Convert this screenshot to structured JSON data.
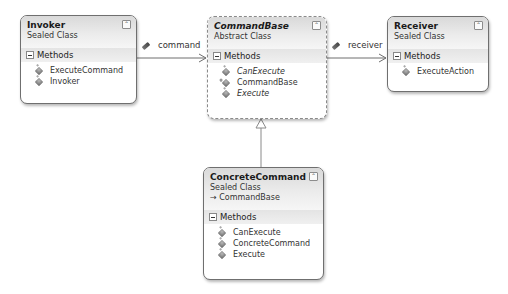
{
  "diagram": {
    "classes": {
      "invoker": {
        "name": "Invoker",
        "kind": "Sealed Class",
        "section": "Methods",
        "methods": [
          "ExecuteCommand",
          "Invoker"
        ]
      },
      "command_base": {
        "name": "CommandBase",
        "kind": "Abstract Class",
        "section": "Methods",
        "methods": [
          "CanExecute",
          "CommandBase",
          "Execute"
        ]
      },
      "receiver": {
        "name": "Receiver",
        "kind": "Sealed Class",
        "section": "Methods",
        "methods": [
          "ExecuteAction"
        ]
      },
      "concrete_command": {
        "name": "ConcreteCommand",
        "kind": "Sealed Class",
        "base": "→ CommandBase",
        "section": "Methods",
        "methods": [
          "CanExecute",
          "ConcreteCommand",
          "Execute"
        ]
      }
    },
    "associations": {
      "command": "command",
      "receiver": "receiver"
    },
    "collapse_glyph": "⌃",
    "colors": {
      "border": "#6f6f6f",
      "header_top": "#d9d9d9",
      "line": "#6e6e6e"
    }
  }
}
